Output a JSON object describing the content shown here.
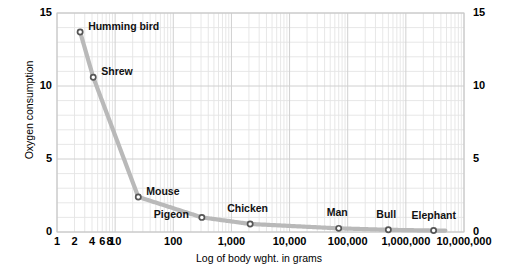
{
  "chart_data": {
    "type": "line",
    "title": "",
    "xlabel": "Log of body wght. in grams",
    "ylabel": "Oxygen consumption",
    "xscale": "log",
    "xlim": [
      1,
      10000000
    ],
    "ylim": [
      0,
      15
    ],
    "grid": true,
    "legend": "none",
    "y_ticks": [
      0,
      5,
      10,
      15
    ],
    "y_tick_labels_left": [
      "0",
      "5",
      "10",
      "15"
    ],
    "y_tick_labels_right": [
      "0",
      "5",
      "10",
      "15"
    ],
    "y_minor_step": 1,
    "x_ticks": [
      1,
      2,
      4,
      6,
      8,
      10,
      100,
      1000,
      10000,
      100000,
      1000000,
      10000000
    ],
    "x_tick_labels": [
      "1",
      "2",
      "4",
      "6",
      "8",
      "10",
      "100",
      "1,000",
      "10,000",
      "100,000",
      "1,000,000",
      "10,000,000"
    ],
    "series": [
      {
        "name": "Oxygen consumption vs body weight",
        "color": "#b9b9b9",
        "marker": "open-circle",
        "x": [
          2.5,
          4.2,
          25,
          310,
          2100,
          70000,
          500000,
          3000000
        ],
        "y": [
          13.7,
          10.6,
          2.4,
          1.0,
          0.55,
          0.25,
          0.15,
          0.1
        ],
        "point_labels": [
          "Humming bird",
          "Shrew",
          "Mouse",
          "Pigeon",
          "Chicken",
          "Man",
          "Bull",
          "Elephant"
        ]
      }
    ],
    "annotations": [
      {
        "text": "Humming bird",
        "x": 2.5,
        "y": 13.7,
        "placement": "right"
      },
      {
        "text": "Shrew",
        "x": 4.2,
        "y": 10.6,
        "placement": "right"
      },
      {
        "text": "Mouse",
        "x": 25,
        "y": 2.4,
        "placement": "right"
      },
      {
        "text": "Pigeon",
        "x": 310,
        "y": 1.0,
        "placement": "left-below"
      },
      {
        "text": "Chicken",
        "x": 2100,
        "y": 0.55,
        "placement": "above"
      },
      {
        "text": "Man",
        "x": 70000,
        "y": 0.25,
        "placement": "above"
      },
      {
        "text": "Bull",
        "x": 500000,
        "y": 0.15,
        "placement": "above"
      },
      {
        "text": "Elephant",
        "x": 3000000,
        "y": 0.1,
        "placement": "above"
      }
    ]
  },
  "axes": {
    "y_title": "Oxygen consumption",
    "x_title": "Log of body wght. in grams",
    "y_left": [
      "15",
      "10",
      "5",
      "0"
    ],
    "y_right": [
      "15",
      "10",
      "5",
      "0"
    ],
    "x": [
      "1",
      "2",
      "4",
      "6",
      "8",
      "10",
      "100",
      "1,000",
      "10,000",
      "100,000",
      "1,000,000",
      "10,000,000"
    ]
  },
  "points": {
    "humming_bird": "Humming bird",
    "shrew": "Shrew",
    "mouse": "Mouse",
    "pigeon": "Pigeon",
    "chicken": "Chicken",
    "man": "Man",
    "bull": "Bull",
    "elephant": "Elephant"
  },
  "colors": {
    "curve": "#b9b9b9",
    "grid_major": "#d0d0d0",
    "grid_minor": "#e4e4e4",
    "text": "#000000",
    "marker_edge": "#555555",
    "background": "#ffffff"
  }
}
